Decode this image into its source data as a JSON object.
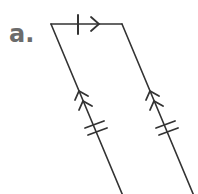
{
  "figure": {
    "label": "a.",
    "shape": "parallelogram",
    "colors": {
      "stroke": "#333333",
      "label": "#6b6b6b"
    },
    "vertices": {
      "top_left": [
        51,
        24
      ],
      "top_right": [
        122,
        24
      ],
      "bottom_left": [
        121,
        194
      ],
      "bottom_right": [
        193,
        194
      ]
    },
    "markings": {
      "top_side": [
        "single tick mark",
        "single arrow (parallel marker)"
      ],
      "left_side": [
        "double arrow (parallel marker)",
        "double tick marks (congruent)"
      ],
      "right_side": [
        "double arrow (parallel marker)",
        "double tick marks (congruent)"
      ]
    }
  }
}
